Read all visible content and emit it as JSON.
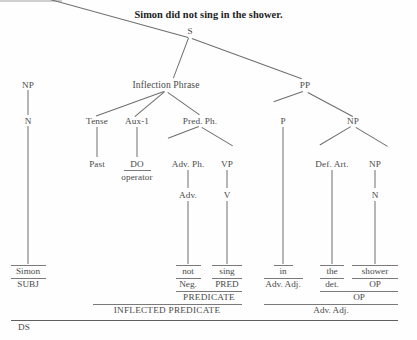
{
  "diagram": {
    "title": "Simon did not sing in the shower.",
    "type": "syntactic-tree",
    "nodes": {
      "s": "S",
      "np_subject": "NP",
      "n_subject": "N",
      "inflection_phrase": "Inflection Phrase",
      "tense": "Tense",
      "past": "Past",
      "aux1": "Aux-1",
      "do": "DO",
      "operator": "operator",
      "pred_ph": "Pred. Ph.",
      "adv_ph": "Adv. Ph.",
      "adv": "Adv.",
      "vp": "VP",
      "v": "V",
      "pp": "PP",
      "p": "P",
      "np_object": "NP",
      "def_art": "Def. Art.",
      "np_inner": "NP",
      "n_object": "N"
    },
    "terminals": {
      "simon": "Simon",
      "not": "not",
      "sing": "sing",
      "in": "in",
      "the": "the",
      "shower": "shower"
    },
    "functions": {
      "subj": "SUBJ",
      "neg": "Neg.",
      "pred": "PRED",
      "adv_adj_in": "Adv. Adj.",
      "det": "det.",
      "op_shower": "OP",
      "predicate": "PREDICATE",
      "op_phrase": "OP",
      "inflected_predicate": "INFLECTED PREDICATE",
      "adv_adj_phrase": "Adv. Adj.",
      "ds": "DS"
    },
    "colors": {
      "ink": "#4a4a4a",
      "line": "#6e6e6e",
      "rule": "#7a7a7a",
      "title": "#1d1d1d",
      "background": "#fefefe"
    }
  }
}
